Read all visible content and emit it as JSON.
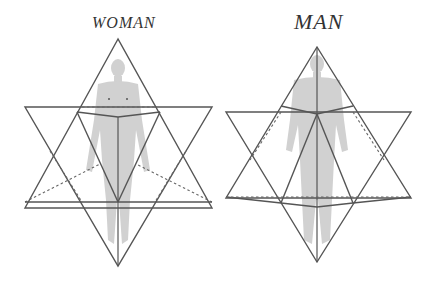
{
  "diagram": {
    "title_left": "WOMAN",
    "title_right": "MAN",
    "figures": [
      {
        "name": "woman",
        "description": "Female human figure inside star tetrahedron"
      },
      {
        "name": "man",
        "description": "Male human figure inside star tetrahedron"
      }
    ],
    "colors": {
      "line": "#555555",
      "figure": "#c9c9c9",
      "background": "#ffffff"
    }
  }
}
